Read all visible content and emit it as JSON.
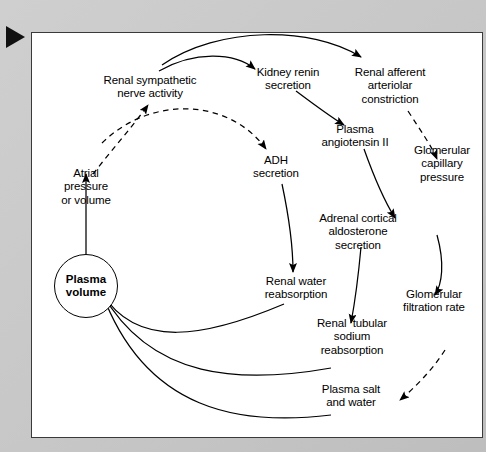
{
  "figure": {
    "marker_icon": "play-triangle-icon",
    "background_color": "#c6c6c6",
    "panel_color": "#ffffff",
    "line_color": "#000000"
  },
  "nodes": [
    {
      "id": "renal_sympathetic",
      "label": "Renal sympathetic\nnerve activity",
      "x": 150,
      "y": 88,
      "shape": "text"
    },
    {
      "id": "kidney_renin",
      "label": "Kidney renin\nsecretion",
      "x": 288,
      "y": 80,
      "shape": "text"
    },
    {
      "id": "renal_afferent",
      "label": "Renal afferent\narteriolar\nconstriction",
      "x": 390,
      "y": 87,
      "shape": "text"
    },
    {
      "id": "plasma_angiotensin",
      "label": "Plasma\nangiotensin II",
      "x": 355,
      "y": 137,
      "shape": "text"
    },
    {
      "id": "glomerular_capillary",
      "label": "Glomerular\ncapillary\npressure",
      "x": 442,
      "y": 165,
      "shape": "text"
    },
    {
      "id": "adh",
      "label": "ADH\nsecretion",
      "x": 276,
      "y": 167,
      "shape": "text"
    },
    {
      "id": "atrial_pressure",
      "label": "Atrial\npressure\nor volume",
      "x": 86,
      "y": 187,
      "shape": "text"
    },
    {
      "id": "adrenal_cortical",
      "label": "Adrenal cortical\naldosterone\nsecretion",
      "x": 358,
      "y": 233,
      "shape": "text"
    },
    {
      "id": "plasma_volume",
      "label": "Plasma\nvolume",
      "x": 86,
      "y": 286,
      "shape": "circle"
    },
    {
      "id": "renal_water",
      "label": "Renal water\nreabsorption",
      "x": 296,
      "y": 288,
      "shape": "text"
    },
    {
      "id": "glomerular_filtration",
      "label": "Glomerular\nfiltration rate",
      "x": 434,
      "y": 301,
      "shape": "text"
    },
    {
      "id": "renal_tubular",
      "label": "Renal  tubular\nsodium\nreabsorption",
      "x": 352,
      "y": 337,
      "shape": "text"
    },
    {
      "id": "plasma_salt",
      "label": "Plasma salt\nand water",
      "x": 351,
      "y": 396,
      "shape": "text"
    }
  ],
  "edges": [
    {
      "id": "e1",
      "from": "renal_sympathetic",
      "to": "kidney_renin",
      "style": "solid"
    },
    {
      "id": "e2",
      "from": "renal_sympathetic",
      "to": "renal_afferent",
      "style": "solid"
    },
    {
      "id": "e3",
      "from": "kidney_renin",
      "to": "plasma_angiotensin",
      "style": "solid"
    },
    {
      "id": "e4",
      "from": "renal_afferent",
      "to": "glomerular_capillary",
      "style": "dashed"
    },
    {
      "id": "e5",
      "from": "plasma_angiotensin",
      "to": "adrenal_cortical",
      "style": "solid"
    },
    {
      "id": "e6",
      "from": "atrial_pressure",
      "to": "renal_sympathetic",
      "style": "dashed"
    },
    {
      "id": "e7",
      "from": "atrial_pressure",
      "to": "adh",
      "style": "dashed"
    },
    {
      "id": "e8",
      "from": "plasma_volume",
      "to": "atrial_pressure",
      "style": "solid"
    },
    {
      "id": "e9",
      "from": "adh",
      "to": "renal_water",
      "style": "solid"
    },
    {
      "id": "e10",
      "from": "adrenal_cortical",
      "to": "renal_tubular",
      "style": "solid"
    },
    {
      "id": "e11",
      "from": "glomerular_capillary",
      "to": "glomerular_filtration",
      "style": "solid"
    },
    {
      "id": "e12",
      "from": "glomerular_filtration",
      "to": "plasma_salt",
      "style": "dashed"
    },
    {
      "id": "e13",
      "from": "renal_water",
      "to": "plasma_volume",
      "style": "solid"
    },
    {
      "id": "e14",
      "from": "renal_tubular",
      "to": "plasma_volume",
      "style": "solid"
    },
    {
      "id": "e15",
      "from": "plasma_salt",
      "to": "plasma_volume",
      "style": "solid"
    }
  ]
}
